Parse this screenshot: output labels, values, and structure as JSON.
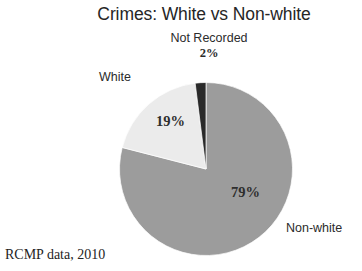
{
  "chart_data": {
    "type": "pie",
    "title": "Crimes: White vs Non-white",
    "categories": [
      "Non-white",
      "White",
      "Not Recorded"
    ],
    "values": [
      79,
      19,
      2
    ],
    "value_labels": [
      "79%",
      "19%",
      "2%"
    ],
    "colors": [
      "#9c9c9c",
      "#ebebeb",
      "#2a2a2a"
    ],
    "legend": "none",
    "labels_position": "outside-and-inside",
    "start_angle_deg": 0,
    "direction": "clockwise",
    "source_note": "RCMP data, 2010",
    "xlabel": "",
    "ylabel": ""
  },
  "title": {
    "text": "Crimes: White vs Non-white"
  },
  "slices": {
    "nonwhite": {
      "label": "Non-white",
      "percent_label": "79%",
      "color": "#9c9c9c"
    },
    "white": {
      "label": "White",
      "percent_label": "19%",
      "color": "#ebebeb"
    },
    "not_recorded": {
      "label": "Not Recorded",
      "percent_label": "2%",
      "color": "#2a2a2a"
    }
  },
  "footnote": {
    "text": "RCMP data, 2010"
  }
}
